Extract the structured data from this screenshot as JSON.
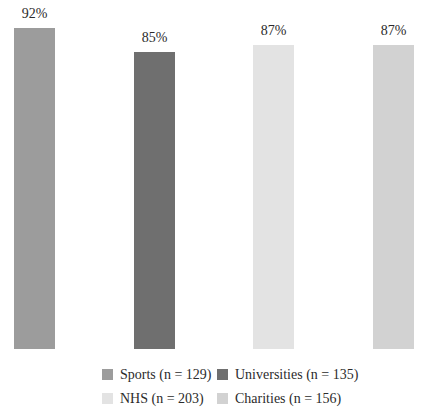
{
  "chart_data": {
    "type": "bar",
    "categories": [
      "Sports",
      "Universities",
      "NHS",
      "Charities"
    ],
    "values": [
      92,
      85,
      87,
      87
    ],
    "value_labels": [
      "92%",
      "85%",
      "87%",
      "87%"
    ],
    "colors": [
      "#9c9c9c",
      "#6f6f6f",
      "#e3e3e3",
      "#d2d2d2"
    ],
    "title": "",
    "xlabel": "",
    "ylabel": "",
    "ylim": [
      0,
      100
    ],
    "grid": false,
    "axes_visible": false,
    "legend": {
      "position": "bottom",
      "rows": 2,
      "columns": 2,
      "entries": [
        {
          "label": "Sports (n = 129)",
          "color": "#9c9c9c"
        },
        {
          "label": "Universities (n = 135)",
          "color": "#6f6f6f"
        },
        {
          "label": "NHS (n = 203)",
          "color": "#e3e3e3"
        },
        {
          "label": "Charities (n = 156)",
          "color": "#d2d2d2"
        }
      ]
    }
  },
  "colors": {
    "background": "#ffffff",
    "label_text": "#2b2b2b"
  }
}
